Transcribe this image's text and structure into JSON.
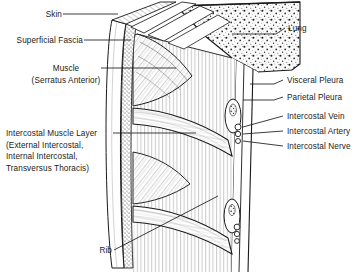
{
  "figure": {
    "width": 364,
    "height": 274,
    "background_color": "#ffffff",
    "ink_color": "#1a1a1a",
    "style": "black-and-white pen-and-ink medical illustration with hatching and stipple shading"
  },
  "labels": {
    "skin": "Skin",
    "superficial_fascia": "Superficial Fascia",
    "muscle_name": "Muscle",
    "muscle_detail": "(Serratus Anterior)",
    "intercostal_layer_1": "Intercostal Muscle Layer",
    "intercostal_layer_2": "(External Intercostal,",
    "intercostal_layer_3": "Internal Intercostal,",
    "intercostal_layer_4": "Transversus Thoracis)",
    "rib": "Rib",
    "lung": "Lung",
    "visceral_pleura": "Visceral Pleura",
    "parietal_pleura": "Parietal Pleura",
    "intercostal_vein": "Intercostal Vein",
    "intercostal_artery": "Intercostal Artery",
    "intercostal_nerve": "Intercostal Nerve"
  },
  "structures": {
    "lung_texture": "stippled spongy parenchyma",
    "neurovascular_bundle": "vein, artery and nerve grouped in the costal groove",
    "rib_count_visible": 2
  }
}
